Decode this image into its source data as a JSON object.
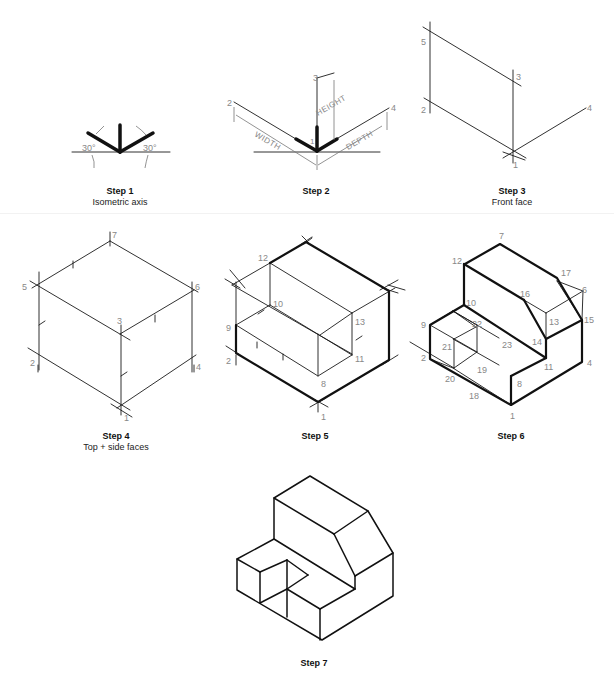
{
  "steps": [
    {
      "title": "Step 1",
      "subtitle": "Isometric axis",
      "angle_left": "30°",
      "angle_right": "30°"
    },
    {
      "title": "Step 2",
      "dim_height": "HEIGHT",
      "dim_width": "WIDTH",
      "dim_depth": "DEPTH",
      "points": {
        "p1": "1",
        "p2": "2",
        "p3": "3",
        "p4": "4"
      }
    },
    {
      "title": "Step 3",
      "subtitle": "Front face",
      "points": {
        "p1": "1",
        "p2": "2",
        "p3": "3",
        "p4": "4",
        "p5": "5"
      }
    },
    {
      "title": "Step 4",
      "subtitle": "Top + side faces",
      "points": {
        "p1": "1",
        "p2": "2",
        "p3": "3",
        "p4": "4",
        "p5": "5",
        "p6": "6",
        "p7": "7"
      }
    },
    {
      "title": "Step 5",
      "points": {
        "p1": "1",
        "p2": "2",
        "p8": "8",
        "p9": "9",
        "p10": "10",
        "p11": "11",
        "p12": "12",
        "p13": "13"
      }
    },
    {
      "title": "Step 6",
      "points": {
        "p1": "1",
        "p2": "2",
        "p4": "4",
        "p6": "6",
        "p7": "7",
        "p8": "8",
        "p9": "9",
        "p10": "10",
        "p11": "11",
        "p12": "12",
        "p13": "13",
        "p14": "14",
        "p15": "15",
        "p16": "16",
        "p17": "17",
        "p18": "18",
        "p19": "19",
        "p20": "20",
        "p21": "21",
        "p22": "22",
        "p23": "23"
      }
    },
    {
      "title": "Step 7"
    }
  ]
}
